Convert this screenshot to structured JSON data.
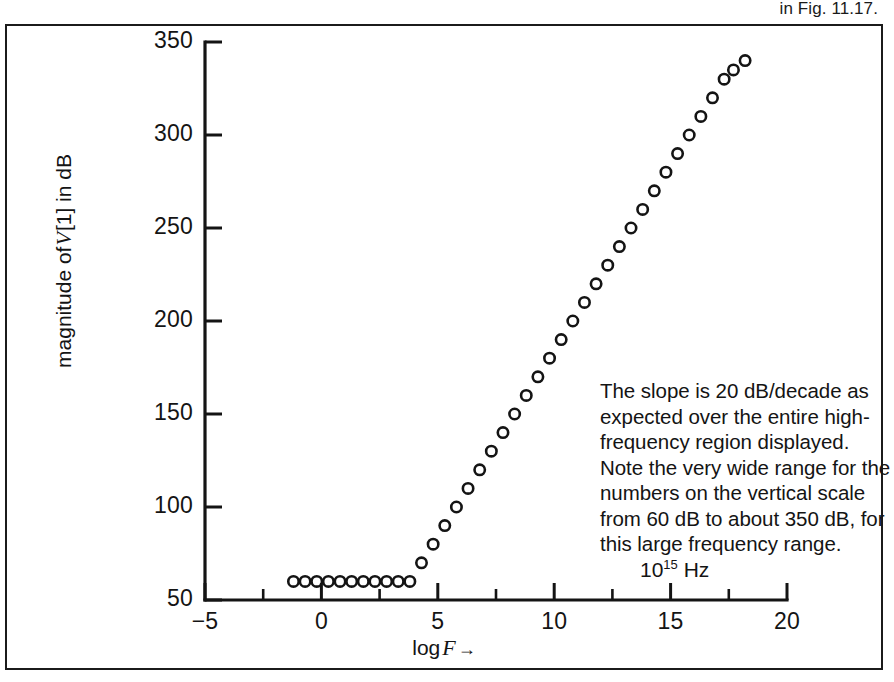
{
  "caption": {
    "text": "in Fig. 11.17."
  },
  "annotation": {
    "lines": [
      "The slope is 20 dB/decade as",
      "expected over the entire high-",
      "frequency region displayed.",
      "Note the very wide range for the",
      "numbers on the vertical scale",
      "from 60 dB to about 350 dB, for",
      "this large frequency range."
    ]
  },
  "unit_label": {
    "base": "10",
    "exponent": "15",
    "unit": "Hz"
  },
  "axis_titles": {
    "y_prefix": "magnitude of",
    "y_symbol": "V",
    "y_suffix": "[1] in dB",
    "x_prefix": "log",
    "x_symbol": "F",
    "x_arrow": "→"
  },
  "colors": {
    "ink": "#141414",
    "frame": "#1b1b1b",
    "background": "#ffffff"
  },
  "chart_data": {
    "type": "scatter",
    "title": "",
    "xlabel": "log F →",
    "ylabel": "magnitude of V[1] in dB",
    "xlim": [
      -5,
      20
    ],
    "ylim": [
      50,
      350
    ],
    "xticks": [
      -5,
      0,
      5,
      10,
      15,
      20
    ],
    "xtick_labels": [
      "−5",
      "0",
      "5",
      "10",
      "15",
      "20"
    ],
    "xticks_minor": [
      -2.5,
      2.5,
      7.5,
      12.5,
      17.5
    ],
    "yticks": [
      50,
      100,
      150,
      200,
      250,
      300,
      350
    ],
    "ytick_labels": [
      "50",
      "100",
      "150",
      "200",
      "250",
      "300",
      "350"
    ],
    "grid": false,
    "legend": null,
    "marker": "open-circle",
    "series": [
      {
        "name": "magnitude of V[1]",
        "x": [
          -1.2,
          -0.7,
          -0.2,
          0.3,
          0.8,
          1.3,
          1.8,
          2.3,
          2.8,
          3.3,
          3.8,
          4.3,
          4.8,
          5.3,
          5.8,
          6.3,
          6.8,
          7.3,
          7.8,
          8.3,
          8.8,
          9.3,
          9.8,
          10.3,
          10.8,
          11.3,
          11.8,
          12.3,
          12.8,
          13.3,
          13.8,
          14.3,
          14.8,
          15.3,
          15.8,
          16.3,
          16.8,
          17.3,
          17.7,
          18.2
        ],
        "y": [
          60,
          60,
          60,
          60,
          60,
          60,
          60,
          60,
          60,
          60,
          60,
          70,
          80,
          90,
          100,
          110,
          120,
          130,
          140,
          150,
          160,
          170,
          180,
          190,
          200,
          210,
          220,
          230,
          240,
          250,
          260,
          270,
          280,
          290,
          300,
          310,
          320,
          330,
          335,
          340
        ]
      }
    ]
  }
}
